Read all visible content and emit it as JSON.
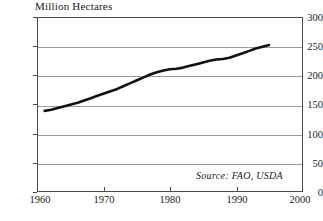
{
  "chart_data": {
    "type": "line",
    "title": "Million Hectares",
    "xlabel": "",
    "ylabel": "Million Hectares",
    "xlim": [
      1960,
      2000
    ],
    "ylim": [
      0,
      300
    ],
    "xticks": [
      1960,
      1970,
      1980,
      1990,
      2000
    ],
    "yticks": [
      0,
      50,
      100,
      150,
      200,
      250,
      300
    ],
    "grid": true,
    "legend": "none",
    "annotation": "Source: FAO, USDA",
    "series": [
      {
        "name": "Irrigated Area",
        "color": "#111111",
        "x": [
          1961,
          1962,
          1963,
          1964,
          1965,
          1966,
          1967,
          1968,
          1969,
          1970,
          1971,
          1972,
          1973,
          1974,
          1975,
          1976,
          1977,
          1978,
          1979,
          1980,
          1981,
          1982,
          1983,
          1984,
          1985,
          1986,
          1987,
          1988,
          1989,
          1990,
          1991,
          1992,
          1993,
          1994,
          1995
        ],
        "values": [
          139,
          141,
          144,
          147,
          150,
          153,
          157,
          161,
          165,
          169,
          173,
          177,
          182,
          187,
          192,
          197,
          202,
          206,
          209,
          211,
          212,
          214,
          217,
          220,
          223,
          226,
          228,
          229,
          231,
          235,
          239,
          243,
          247,
          250,
          253
        ]
      }
    ]
  },
  "axis": {
    "y_labels": [
      "300",
      "250",
      "200",
      "150",
      "100",
      "50",
      "0"
    ],
    "x_labels": [
      "1960",
      "1970",
      "1980",
      "1990",
      "2000"
    ]
  },
  "source": {
    "text": "Source: FAO, USDA"
  }
}
